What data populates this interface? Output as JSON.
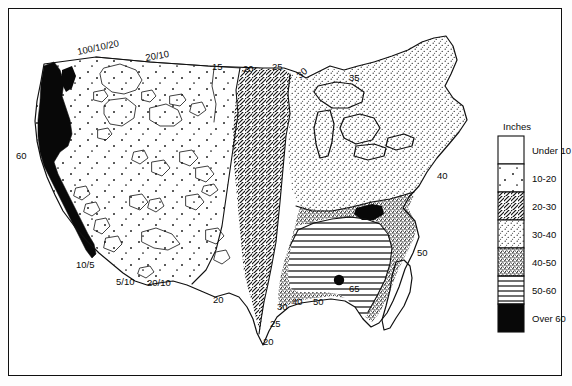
{
  "figure": {
    "type": "thematic-map",
    "frame_border_color": "#101010",
    "background_color": "#ffffff"
  },
  "legend": {
    "title": "Inches",
    "entries": [
      {
        "label": "Under 10",
        "pattern": "blank",
        "order": 1
      },
      {
        "label": "10-20",
        "pattern": "sparse-dots",
        "order": 2
      },
      {
        "label": "20-30",
        "pattern": "diagonal-hatch",
        "order": 3
      },
      {
        "label": "30-40",
        "pattern": "fine-stipple",
        "order": 4
      },
      {
        "label": "40-50",
        "pattern": "dense-stipple",
        "order": 5
      },
      {
        "label": "50-60",
        "pattern": "horizontal-lines",
        "order": 6
      },
      {
        "label": "Over 60",
        "pattern": "solid-black",
        "order": 7
      }
    ]
  },
  "map_labels": [
    {
      "id": "lbl-100-10-20",
      "text": "100/10/20",
      "x": 78,
      "y": 55,
      "rotation": -12
    },
    {
      "id": "lbl-20-10-top",
      "text": "20/10",
      "x": 146,
      "y": 61,
      "rotation": -10
    },
    {
      "id": "lbl-15",
      "text": "15",
      "x": 212,
      "y": 70,
      "rotation": 0
    },
    {
      "id": "lbl-20-top",
      "text": "20",
      "x": 243,
      "y": 72,
      "rotation": 0
    },
    {
      "id": "lbl-25-top",
      "text": "25",
      "x": 272,
      "y": 70,
      "rotation": 0
    },
    {
      "id": "lbl-30-top",
      "text": "30",
      "x": 300,
      "y": 79,
      "rotation": -40
    },
    {
      "id": "lbl-35",
      "text": "35",
      "x": 349,
      "y": 81,
      "rotation": 0
    },
    {
      "id": "lbl-60-left",
      "text": "60",
      "x": 16,
      "y": 159,
      "rotation": 0
    },
    {
      "id": "lbl-40-right",
      "text": "40",
      "x": 437,
      "y": 179,
      "rotation": 0
    },
    {
      "id": "lbl-50-right",
      "text": "50",
      "x": 417,
      "y": 256,
      "rotation": 0
    },
    {
      "id": "lbl-10-5",
      "text": "10/5",
      "x": 76,
      "y": 268,
      "rotation": 0
    },
    {
      "id": "lbl-5-10",
      "text": "5/10",
      "x": 116,
      "y": 285,
      "rotation": 0
    },
    {
      "id": "lbl-20-10-bottom",
      "text": "20/10",
      "x": 147,
      "y": 286,
      "rotation": 0
    },
    {
      "id": "lbl-20-lower",
      "text": "20",
      "x": 213,
      "y": 303,
      "rotation": 0
    },
    {
      "id": "lbl-30-bottom",
      "text": "30",
      "x": 277,
      "y": 310,
      "rotation": 0
    },
    {
      "id": "lbl-25-bottom",
      "text": "25",
      "x": 270,
      "y": 327,
      "rotation": 0
    },
    {
      "id": "lbl-20-bottom",
      "text": "20",
      "x": 263,
      "y": 345,
      "rotation": 0
    },
    {
      "id": "lbl-40-bottom",
      "text": "40",
      "x": 292,
      "y": 305,
      "rotation": 0
    },
    {
      "id": "lbl-50-bottom",
      "text": "50",
      "x": 313,
      "y": 305,
      "rotation": 0
    },
    {
      "id": "lbl-65",
      "text": "65",
      "x": 349,
      "y": 292,
      "rotation": 0
    }
  ]
}
